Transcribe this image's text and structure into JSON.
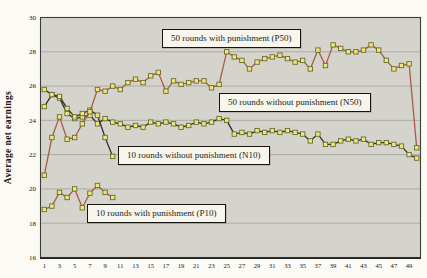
{
  "figure": {
    "ylabel": "Average net earnings",
    "annotations": [
      {
        "id": "P50",
        "text": "50 rounds with punishment (P50)"
      },
      {
        "id": "N50",
        "text": "50 rounds without punishment (N50)"
      },
      {
        "id": "N10",
        "text": "10 rounds without punishment (N10)"
      },
      {
        "id": "P10",
        "text": "10 rounds with punishment (P10)"
      }
    ]
  },
  "chart_data": {
    "type": "line",
    "title": "",
    "xlabel": "",
    "ylabel": "Average net earnings",
    "xlim": [
      0.5,
      50.5
    ],
    "ylim": [
      16,
      30
    ],
    "x_ticks": [
      1,
      3,
      5,
      7,
      9,
      11,
      13,
      15,
      17,
      19,
      21,
      23,
      25,
      27,
      29,
      31,
      33,
      35,
      37,
      39,
      41,
      43,
      45,
      47,
      49
    ],
    "y_ticks": [
      16,
      18,
      20,
      22,
      24,
      26,
      28,
      30
    ],
    "grid": "horizontal",
    "legend_position": "boxed-annotations-inside-plot",
    "marker": "square",
    "colors": {
      "plot_bg": "#d4d4cc",
      "grid": "#a2a29a",
      "frame": "#3c3c38",
      "axis": "#222220",
      "marker_fill": "#ebe77b",
      "marker_stroke": "#6a6a2e",
      "punishment_line": "#aa5a48",
      "no_punishment_line": "#33332e"
    },
    "series": [
      {
        "name": "50 rounds without punishment (N50)",
        "id": "N50",
        "color": "#33332e",
        "x_start": 1,
        "values": [
          24.8,
          25.5,
          25.3,
          24.4,
          24.1,
          24.2,
          24.3,
          23.8,
          24.1,
          23.9,
          23.8,
          23.6,
          23.7,
          23.6,
          23.9,
          23.8,
          23.9,
          23.8,
          23.6,
          23.7,
          23.9,
          23.8,
          23.9,
          24.1,
          24.0,
          23.2,
          23.3,
          23.2,
          23.4,
          23.3,
          23.4,
          23.3,
          23.4,
          23.3,
          23.2,
          22.8,
          23.2,
          22.6,
          22.6,
          22.8,
          22.9,
          22.8,
          22.9,
          22.6,
          22.7,
          22.7,
          22.6,
          22.5,
          22.0,
          21.8
        ]
      },
      {
        "name": "10 rounds without punishment (N10)",
        "id": "N10",
        "color": "#33332e",
        "x_start": 1,
        "values": [
          25.8,
          25.5,
          25.4,
          24.7,
          24.2,
          24.4,
          24.6,
          24.3,
          23.0,
          21.9
        ]
      },
      {
        "name": "10 rounds with punishment (P10)",
        "id": "P10",
        "color": "#aa5a48",
        "x_start": 1,
        "values": [
          18.8,
          19.0,
          19.8,
          19.5,
          20.0,
          18.9,
          19.75,
          20.2,
          19.8,
          19.5
        ]
      },
      {
        "name": "50 rounds with punishment (P50)",
        "id": "P50",
        "color": "#aa5a48",
        "x_start": 1,
        "values": [
          20.8,
          23.0,
          24.2,
          22.9,
          23.0,
          23.8,
          24.5,
          25.8,
          25.7,
          26.0,
          25.8,
          26.2,
          26.4,
          26.2,
          26.6,
          26.8,
          25.7,
          26.3,
          26.1,
          26.2,
          26.3,
          26.3,
          25.9,
          26.1,
          28.0,
          27.7,
          27.5,
          27.0,
          27.4,
          27.6,
          27.7,
          27.8,
          27.6,
          27.4,
          27.5,
          27.0,
          28.1,
          27.2,
          28.4,
          28.2,
          28.0,
          28.0,
          28.1,
          28.4,
          28.1,
          27.5,
          27.0,
          27.2,
          27.3,
          22.4
        ]
      }
    ]
  }
}
